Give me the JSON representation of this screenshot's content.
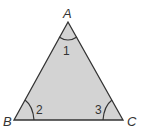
{
  "diagram": {
    "type": "triangle",
    "fill": "#d3d3d3",
    "stroke": "#333333",
    "vertices": [
      {
        "name": "A",
        "x": 68,
        "y": 22
      },
      {
        "name": "B",
        "x": 14,
        "y": 120
      },
      {
        "name": "C",
        "x": 123,
        "y": 120
      }
    ],
    "angles": [
      {
        "label": "1",
        "vertex": "A"
      },
      {
        "label": "2",
        "vertex": "B"
      },
      {
        "label": "3",
        "vertex": "C"
      }
    ]
  }
}
